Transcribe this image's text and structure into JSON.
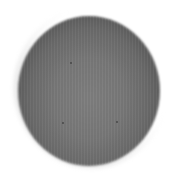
{
  "image": {
    "description": "Grayscale image of a spherical object with darker edges and lighter center, faint halo on a white background",
    "background_color": "#ffffff",
    "sphere": {
      "center_color": "#7f7f7f",
      "edge_color": "#4a4a4a"
    },
    "specks": [
      {
        "x": 70,
        "y": 62
      },
      {
        "x": 62,
        "y": 122
      },
      {
        "x": 116,
        "y": 121
      }
    ]
  }
}
